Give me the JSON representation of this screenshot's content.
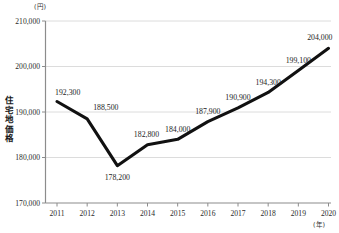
{
  "chart_data": {
    "type": "line",
    "title": "",
    "xlabel": "(年)",
    "ylabel": "住宅地価格",
    "yunit": "(円)",
    "categories": [
      "2011",
      "2012",
      "2013",
      "2014",
      "2015",
      "2016",
      "2017",
      "2018",
      "2019",
      "2020"
    ],
    "values": [
      192300,
      188500,
      178200,
      182800,
      184000,
      187900,
      190900,
      194300,
      199100,
      204000
    ],
    "point_labels": [
      "192,300",
      "188,500",
      "178,200",
      "182,800",
      "184,000",
      "187,900",
      "190,900",
      "194,300",
      "199,100",
      "204,000"
    ],
    "ylim": [
      170000,
      210000
    ],
    "yticks": [
      170000,
      180000,
      190000,
      200000,
      210000
    ],
    "ytick_labels": [
      "170,000",
      "180,000",
      "190,000",
      "200,000",
      "210,000"
    ],
    "grid": true,
    "legend": "none",
    "line_color": "#111111",
    "grid_color": "#d8d8d8",
    "axis_color": "#888888"
  },
  "axis": {
    "y_label_chars": [
      "住",
      "宅",
      "地",
      "価",
      "格"
    ]
  }
}
